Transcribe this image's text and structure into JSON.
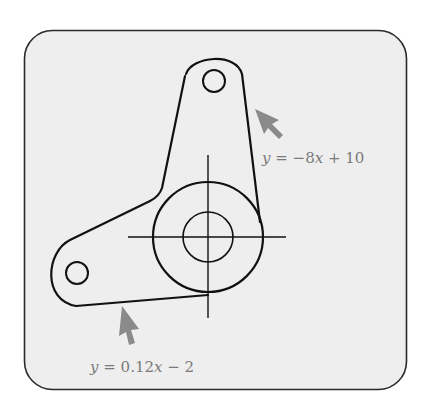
{
  "figure": {
    "panel": {
      "fill": "#eeeeee",
      "stroke": "#2a2a2a"
    },
    "part_stroke": "#111111",
    "arrow_color": "#8a8a8a",
    "label_color": "#7a7a7a",
    "labels": {
      "upper_edge": {
        "y_var": "y",
        "equals": " = ",
        "minus": "−",
        "coef": "8",
        "x_var": "x",
        "rest": " + 10"
      },
      "lower_edge": {
        "y_var": "y",
        "equals": " = ",
        "coef": "0.12",
        "x_var": "x",
        "rest": " − 2"
      }
    },
    "elements": [
      "rounded-panel",
      "bracket-outline",
      "top-hole",
      "left-hole",
      "hub-outer-circle",
      "hub-inner-circle",
      "center-crosshair",
      "arrow-upper-edge",
      "arrow-lower-edge"
    ]
  }
}
